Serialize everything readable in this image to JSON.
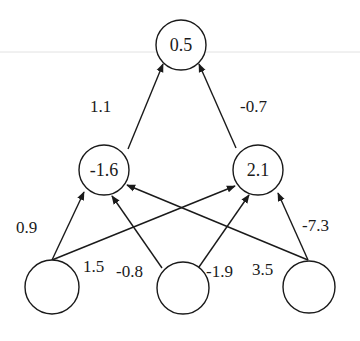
{
  "diagram": {
    "type": "neural-network",
    "layers": {
      "output": [
        {
          "id": "o1",
          "label": "0.5",
          "cx": 181,
          "cy": 45,
          "r": 25
        }
      ],
      "hidden": [
        {
          "id": "h1",
          "label": "-1.6",
          "cx": 104,
          "cy": 170,
          "r": 25
        },
        {
          "id": "h2",
          "label": "2.1",
          "cx": 258,
          "cy": 170,
          "r": 25
        }
      ],
      "input": [
        {
          "id": "i1",
          "label": "",
          "cx": 52,
          "cy": 287,
          "r": 27
        },
        {
          "id": "i2",
          "label": "",
          "cx": 183,
          "cy": 288,
          "r": 26
        },
        {
          "id": "i3",
          "label": "",
          "cx": 309,
          "cy": 287,
          "r": 26
        }
      ]
    },
    "edges": [
      {
        "from": "h1",
        "to": "o1",
        "weight": "1.1",
        "x1": 128,
        "y1": 149,
        "x2": 163,
        "y2": 64,
        "lx": 90,
        "ly": 112
      },
      {
        "from": "h2",
        "to": "o1",
        "weight": "-0.7",
        "x1": 236,
        "y1": 148,
        "x2": 199,
        "y2": 64,
        "lx": 240,
        "ly": 112
      },
      {
        "from": "i1",
        "to": "h1",
        "weight": "0.9",
        "x1": 52,
        "y1": 260,
        "x2": 84,
        "y2": 192,
        "lx": 16,
        "ly": 233
      },
      {
        "from": "i1",
        "to": "h2",
        "weight": "1.5",
        "x1": 52,
        "y1": 260,
        "x2": 235,
        "y2": 186,
        "lx": 83,
        "ly": 272
      },
      {
        "from": "i2",
        "to": "h1",
        "weight": "-0.8",
        "x1": 162,
        "y1": 268,
        "x2": 112,
        "y2": 196,
        "lx": 116,
        "ly": 277
      },
      {
        "from": "i2",
        "to": "h2",
        "weight": "-1.9",
        "x1": 199,
        "y1": 267,
        "x2": 249,
        "y2": 195,
        "lx": 206,
        "ly": 277
      },
      {
        "from": "i3",
        "to": "h1",
        "weight": "3.5",
        "x1": 308,
        "y1": 260,
        "x2": 127,
        "y2": 185,
        "lx": 252,
        "ly": 275
      },
      {
        "from": "i3",
        "to": "h2",
        "weight": "-7.3",
        "x1": 308,
        "y1": 260,
        "x2": 278,
        "y2": 193,
        "lx": 302,
        "ly": 231
      }
    ]
  }
}
